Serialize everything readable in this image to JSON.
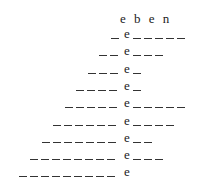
{
  "header": {
    "text": "e b e n"
  },
  "rows": [
    {
      "before": 1,
      "letter": "e",
      "after": 5
    },
    {
      "before": 2,
      "letter": "e",
      "after": 3
    },
    {
      "before": 3,
      "letter": "e",
      "after": 1
    },
    {
      "before": 4,
      "letter": "e",
      "after": 1
    },
    {
      "before": 5,
      "letter": "e",
      "after": 5
    },
    {
      "before": 6,
      "letter": "e",
      "after": 4
    },
    {
      "before": 7,
      "letter": "e",
      "after": 2
    },
    {
      "before": 8,
      "letter": "e",
      "after": 3
    },
    {
      "before": 9,
      "letter": "e",
      "after": 0
    }
  ]
}
